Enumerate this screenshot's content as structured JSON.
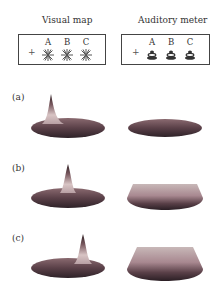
{
  "header": {
    "visual_title": "Visual map",
    "auditory_title": "Auditory meter"
  },
  "visual_box": {
    "fixation": "+",
    "targets": [
      {
        "label": "A",
        "icon": "star-burst-icon"
      },
      {
        "label": "B",
        "icon": "star-burst-icon"
      },
      {
        "label": "C",
        "icon": "star-burst-icon"
      }
    ]
  },
  "auditory_box": {
    "fixation": "+",
    "targets": [
      {
        "label": "A",
        "icon": "speaker-icon"
      },
      {
        "label": "B",
        "icon": "speaker-icon"
      },
      {
        "label": "C",
        "icon": "speaker-icon"
      }
    ]
  },
  "panels": [
    {
      "label": "(a)",
      "visual": "narrow peak at left (position A)",
      "auditory": "flat, no elevation"
    },
    {
      "label": "(b)",
      "visual": "narrow peak at center (position B)",
      "auditory": "moderate raised plateau"
    },
    {
      "label": "(c)",
      "visual": "narrow peak at right (position C)",
      "auditory": "higher raised plateau"
    }
  ],
  "colors": {
    "surface_dark": "#3a2a30",
    "surface_mid": "#7a5a60",
    "surface_light": "#c8b0b0",
    "peak_top": "#2a1a1e"
  }
}
